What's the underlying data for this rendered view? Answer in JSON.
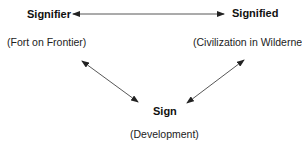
{
  "diagram": {
    "nodes": {
      "signifier": {
        "term": "Signifier",
        "example": "(Fort on Frontier)"
      },
      "signified": {
        "term": "Signified",
        "example": "(Civilization in Wilderness)"
      },
      "sign": {
        "term": "Sign",
        "example": "(Development)"
      }
    },
    "edges": [
      {
        "from": "signifier",
        "to": "signified",
        "type": "bidirectional-arrow"
      },
      {
        "from": "signifier",
        "to": "sign",
        "type": "bidirectional-arrow"
      },
      {
        "from": "signified",
        "to": "sign",
        "type": "bidirectional-arrow"
      }
    ],
    "colors": {
      "text": "#111111",
      "arrow": "#333333",
      "background": "#ffffff"
    }
  }
}
